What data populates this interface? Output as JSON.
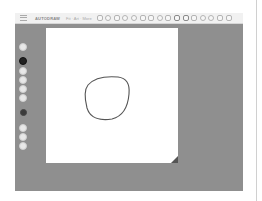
{
  "toolbar": {
    "menu_icon": "hamburger-menu-icon",
    "title": "AUTODRAW",
    "subtitle": "Fit · Art · More",
    "suggestions": [
      {
        "icon": "suggestion-1-icon"
      },
      {
        "icon": "suggestion-2-icon"
      },
      {
        "icon": "suggestion-3-icon"
      },
      {
        "icon": "suggestion-4-icon"
      },
      {
        "icon": "suggestion-5-icon"
      },
      {
        "icon": "suggestion-6-icon"
      },
      {
        "icon": "suggestion-7-icon"
      },
      {
        "icon": "suggestion-8-icon"
      },
      {
        "icon": "suggestion-9-icon"
      },
      {
        "icon": "suggestion-10-icon"
      },
      {
        "icon": "suggestion-11-icon"
      },
      {
        "icon": "suggestion-12-icon"
      },
      {
        "icon": "suggestion-13-icon"
      },
      {
        "icon": "suggestion-14-icon"
      },
      {
        "icon": "suggestion-15-icon"
      },
      {
        "icon": "suggestion-16-icon"
      }
    ]
  },
  "tools": [
    {
      "name": "move-tool",
      "icon": "move-icon",
      "active": false
    },
    {
      "name": "autodraw-tool",
      "icon": "autodraw-icon",
      "active": true
    },
    {
      "name": "draw-tool",
      "icon": "pencil-icon",
      "active": false
    },
    {
      "name": "type-tool",
      "icon": "text-icon",
      "active": false
    },
    {
      "name": "fill-tool",
      "icon": "fill-icon",
      "active": false
    },
    {
      "name": "shape-tool",
      "icon": "shape-icon",
      "active": false
    },
    {
      "name": "color-picker",
      "icon": "color-swatch-icon",
      "color": "#3a3a3a"
    },
    {
      "name": "zoom-tool",
      "icon": "zoom-icon",
      "active": false
    },
    {
      "name": "undo-button",
      "icon": "undo-icon",
      "active": false
    },
    {
      "name": "delete-button",
      "icon": "delete-icon",
      "active": false
    }
  ],
  "canvas": {
    "background": "#ffffff",
    "stroke_color": "#555555"
  },
  "colors": {
    "workspace": "#8f8f8f",
    "toolbar": "#f1f1f1",
    "active_tool": "#222222"
  }
}
